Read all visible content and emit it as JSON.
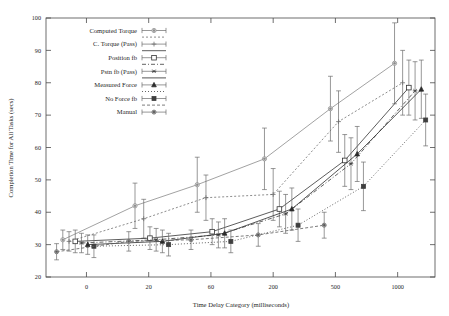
{
  "chart_data": {
    "type": "line",
    "title": "",
    "xlabel": "Time Delay Category (milliseconds)",
    "ylabel": "Completion Time for All Tasks (secs)",
    "grid": false,
    "legend_position": "upper-left",
    "xticks": [
      "0",
      "20",
      "60",
      "200",
      "500",
      "1000"
    ],
    "xtick_positions": [
      1,
      2,
      3,
      4,
      5,
      6
    ],
    "xlim": [
      0.35,
      6.6
    ],
    "yticks": [
      "20",
      "30",
      "40",
      "50",
      "60",
      "70",
      "80",
      "90",
      "100"
    ],
    "ylim": [
      20,
      100
    ],
    "x_categories": [
      0,
      20,
      60,
      200,
      500,
      1000
    ],
    "series": [
      {
        "name": "Computed Torque",
        "marker": "filled-circle",
        "dash": "none",
        "color": "#8a8a8a",
        "x": [
          0.62,
          1.78,
          2.78,
          3.86,
          4.92,
          5.95
        ],
        "values": [
          31.5,
          42.0,
          48.5,
          56.5,
          72.0,
          86.0
        ],
        "err": [
          3.0,
          7.0,
          8.5,
          9.5,
          10.0,
          12.5
        ]
      },
      {
        "name": "C. Torque (Pass)",
        "marker": "plus",
        "dash": "2,2",
        "color": "#6e6e6e",
        "x": [
          0.72,
          1.92,
          2.92,
          4.0,
          5.05,
          6.08
        ],
        "values": [
          31.0,
          38.0,
          44.5,
          45.5,
          68.0,
          80.0
        ],
        "err": [
          3.0,
          6.0,
          7.0,
          8.0,
          9.5,
          10.0
        ]
      },
      {
        "name": "Position fb",
        "marker": "open-square",
        "dash": "none",
        "color": "#333333",
        "x": [
          0.82,
          2.02,
          3.02,
          4.1,
          5.15,
          6.18
        ],
        "values": [
          31.0,
          32.0,
          34.0,
          41.0,
          56.0,
          78.5
        ],
        "err": [
          3.5,
          3.5,
          4.0,
          5.5,
          8.0,
          8.5
        ]
      },
      {
        "name": "Pstn fb (Pass)",
        "marker": "asterisk",
        "dash": "4,2,1,2",
        "color": "#3b3b3b",
        "x": [
          0.92,
          2.12,
          3.12,
          4.2,
          5.25,
          6.28
        ],
        "values": [
          30.5,
          31.5,
          33.0,
          39.5,
          55.0,
          77.5
        ],
        "err": [
          3.0,
          3.5,
          4.0,
          6.0,
          8.0,
          9.0
        ]
      },
      {
        "name": "Measured Force",
        "marker": "filled-triangle",
        "dash": "none",
        "color": "#2b2b2b",
        "x": [
          1.02,
          2.22,
          3.22,
          4.3,
          5.35,
          6.38
        ],
        "values": [
          30.0,
          31.0,
          33.5,
          41.0,
          58.0,
          78.0
        ],
        "err": [
          3.0,
          3.5,
          4.5,
          6.5,
          8.5,
          9.0
        ]
      },
      {
        "name": "No Force fb",
        "marker": "filled-square",
        "dash": "1,2",
        "color": "#3f3f3f",
        "x": [
          1.12,
          2.32,
          3.32,
          4.4,
          5.45,
          6.45
        ],
        "values": [
          29.5,
          30.0,
          31.0,
          36.0,
          48.0,
          68.5
        ],
        "err": [
          3.5,
          3.5,
          3.5,
          5.0,
          7.5,
          8.0
        ]
      },
      {
        "name": "Manual",
        "marker": "filled-circle-sm",
        "dash": "3,2",
        "color": "#5a5a5a",
        "x": [
          0.52,
          1.68,
          2.68,
          3.76,
          4.82
        ],
        "values": [
          27.8,
          31.0,
          31.5,
          33.0,
          36.0
        ],
        "err": [
          2.5,
          3.0,
          3.0,
          3.5,
          4.0
        ]
      }
    ]
  },
  "legend": {
    "entries": [
      {
        "label": "Computed Torque"
      },
      {
        "label": "C. Torque (Pass)"
      },
      {
        "label": "Position fb"
      },
      {
        "label": "Pstn fb (Pass)"
      },
      {
        "label": "Measured Force"
      },
      {
        "label": "No Force fb"
      },
      {
        "label": "Manual"
      }
    ]
  }
}
